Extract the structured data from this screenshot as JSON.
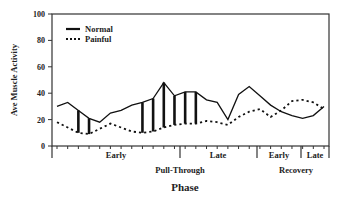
{
  "chart_data": {
    "type": "line",
    "title": "",
    "xlabel": "Phase",
    "ylabel": "Ave Muscle Activity",
    "ylim": [
      0,
      100
    ],
    "yticks": [
      0,
      20,
      40,
      60,
      80,
      100
    ],
    "grid": false,
    "legend_position": "upper left",
    "phase_groups": [
      {
        "label": "Pull-Through",
        "subphases": [
          "Early",
          "Late"
        ]
      },
      {
        "label": "Recovery",
        "subphases": [
          "Early",
          "Late"
        ]
      }
    ],
    "x": [
      1,
      2,
      3,
      4,
      5,
      6,
      7,
      8,
      9,
      10,
      11,
      12,
      13,
      14,
      15,
      16,
      17,
      18,
      19,
      20,
      21,
      22,
      23,
      24,
      25,
      26
    ],
    "series": [
      {
        "name": "Normal",
        "style": "solid",
        "values": [
          30,
          33,
          27,
          21,
          18,
          25,
          27,
          31,
          33,
          36,
          48,
          38,
          41,
          41,
          35,
          33,
          20,
          39,
          45,
          38,
          31,
          26,
          23,
          21,
          23,
          30
        ]
      },
      {
        "name": "Painful",
        "style": "dotted",
        "values": [
          18,
          14,
          10,
          9,
          13,
          17,
          14,
          11,
          10,
          11,
          14,
          16,
          17,
          17,
          19,
          18,
          16,
          22,
          26,
          28,
          22,
          27,
          34,
          35,
          33,
          28
        ]
      }
    ],
    "significant_differences_at_x": [
      3,
      4,
      9,
      10,
      11,
      12,
      13,
      14
    ],
    "annotations": "Vertical bars mark significant differences between Normal and Painful"
  },
  "labels": {
    "yaxis": "Ave Muscle Activity",
    "xaxis": "Phase",
    "legend_normal": "Normal",
    "legend_painful": "Painful",
    "sub_early1": "Early",
    "sub_late1": "Late",
    "sub_early2": "Early",
    "sub_late2": "Late",
    "group1": "Pull-Through",
    "group2": "Recovery"
  }
}
